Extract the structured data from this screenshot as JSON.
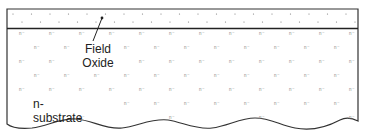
{
  "diagram": {
    "title": "",
    "labels": {
      "field_oxide_line1": "Field",
      "field_oxide_line2": "Oxide",
      "substrate": "n-substrate"
    },
    "doping_marker": "n⁻",
    "oxide_dot_marker": "·",
    "colors": {
      "outline": "#333333",
      "oxide_line": "#222222",
      "dots": "#666666",
      "doping_text": "#8a8a8a",
      "label_text": "#222222"
    },
    "layers": [
      {
        "name": "field-oxide",
        "pattern": "dots"
      },
      {
        "name": "n-substrate",
        "pattern": "n-minus markers"
      }
    ]
  }
}
